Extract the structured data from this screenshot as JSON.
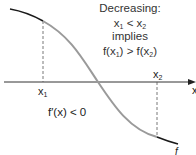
{
  "diagram": {
    "title": "Decreasing:",
    "condition_line": [
      "x",
      "1",
      " < ",
      "x",
      "2"
    ],
    "implies": "implies",
    "result_line": [
      "f(x",
      "1",
      ") > f(x",
      "2",
      ")"
    ],
    "derivative_label": "f′(x) < 0",
    "x1_label": "x",
    "x1_sub": "1",
    "x2_label": "x",
    "x2_sub": "2",
    "axis_label": "x",
    "curve_label": "f",
    "colors": {
      "curve_outer": "#1a1a1a",
      "curve_inner": "#9a9a9a",
      "axis": "#333333",
      "dashed": "#555555",
      "text": "#222222"
    },
    "points": {
      "curve_start": [
        10,
        9
      ],
      "x1_point": [
        43,
        21
      ],
      "inflection": [
        98,
        82
      ],
      "x2_point": [
        157,
        137
      ],
      "curve_end": [
        178,
        144
      ],
      "axis_y": 82
    }
  }
}
